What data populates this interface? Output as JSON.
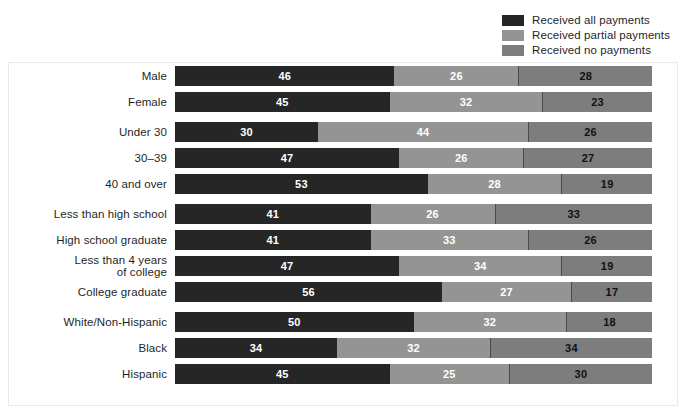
{
  "legend": {
    "items": [
      {
        "label": "Received all payments",
        "color": "#262626",
        "key": "all"
      },
      {
        "label": "Received partial payments",
        "color": "#949494",
        "key": "partial"
      },
      {
        "label": "Received no payments",
        "color": "#7d7d7d",
        "key": "none"
      }
    ]
  },
  "chart_data": {
    "type": "bar",
    "orientation": "horizontal",
    "stacked": true,
    "title": "",
    "subtitle": "",
    "xlabel": "",
    "ylabel": "",
    "xlim": [
      0,
      100
    ],
    "grid": false,
    "legend_position": "top-right",
    "units": "percent",
    "categories": [
      "Male",
      "Female",
      "Under 30",
      "30–39",
      "40 and over",
      "Less than high school",
      "High school graduate",
      "Less than 4 years of college",
      "College graduate",
      "White/Non-Hispanic",
      "Black",
      "Hispanic"
    ],
    "category_label_lines": [
      [
        "Male"
      ],
      [
        "Female"
      ],
      [
        "Under 30"
      ],
      [
        "30–39"
      ],
      [
        "40 and over"
      ],
      [
        "Less than high school"
      ],
      [
        "High school graduate"
      ],
      [
        "Less than 4 years",
        "of college"
      ],
      [
        "College graduate"
      ],
      [
        "White/Non-Hispanic"
      ],
      [
        "Black"
      ],
      [
        "Hispanic"
      ]
    ],
    "group_breaks_before": [
      2,
      5,
      9
    ],
    "series": [
      {
        "name": "Received all payments",
        "values": [
          46,
          45,
          30,
          47,
          53,
          41,
          41,
          47,
          56,
          50,
          34,
          45
        ]
      },
      {
        "name": "Received partial payments",
        "values": [
          26,
          32,
          44,
          26,
          28,
          26,
          33,
          34,
          27,
          32,
          32,
          25
        ]
      },
      {
        "name": "Received no payments",
        "values": [
          28,
          23,
          26,
          27,
          19,
          33,
          26,
          19,
          17,
          18,
          34,
          30
        ]
      }
    ],
    "rows": [
      {
        "label_lines": [
          "Male"
        ],
        "all": 46,
        "partial": 26,
        "none": 28,
        "group_start": false
      },
      {
        "label_lines": [
          "Female"
        ],
        "all": 45,
        "partial": 32,
        "none": 23,
        "group_start": false
      },
      {
        "label_lines": [
          "Under 30"
        ],
        "all": 30,
        "partial": 44,
        "none": 26,
        "group_start": true
      },
      {
        "label_lines": [
          "30–39"
        ],
        "all": 47,
        "partial": 26,
        "none": 27,
        "group_start": false
      },
      {
        "label_lines": [
          "40 and over"
        ],
        "all": 53,
        "partial": 28,
        "none": 19,
        "group_start": false
      },
      {
        "label_lines": [
          "Less than high school"
        ],
        "all": 41,
        "partial": 26,
        "none": 33,
        "group_start": true
      },
      {
        "label_lines": [
          "High school graduate"
        ],
        "all": 41,
        "partial": 33,
        "none": 26,
        "group_start": false
      },
      {
        "label_lines": [
          "Less than 4 years",
          "of college"
        ],
        "all": 47,
        "partial": 34,
        "none": 19,
        "group_start": false
      },
      {
        "label_lines": [
          "College graduate"
        ],
        "all": 56,
        "partial": 27,
        "none": 17,
        "group_start": false
      },
      {
        "label_lines": [
          "White/Non-Hispanic"
        ],
        "all": 50,
        "partial": 32,
        "none": 18,
        "group_start": true
      },
      {
        "label_lines": [
          "Black"
        ],
        "all": 34,
        "partial": 32,
        "none": 34,
        "group_start": false
      },
      {
        "label_lines": [
          "Hispanic"
        ],
        "all": 45,
        "partial": 25,
        "none": 30,
        "group_start": false
      }
    ]
  }
}
